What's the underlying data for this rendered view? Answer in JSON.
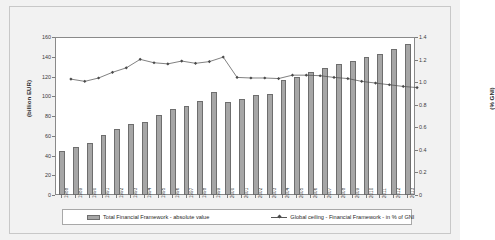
{
  "chart_data": {
    "type": "bar",
    "title": "",
    "xlabel": "",
    "ylabel": "(billion EUR)",
    "ylabel_right": "(% GNI)",
    "ylim": [
      0,
      160
    ],
    "ylim_right": [
      0,
      1.4
    ],
    "yticks": [
      "0",
      "20",
      "40",
      "60",
      "80",
      "100",
      "120",
      "140",
      "160"
    ],
    "yticks_right": [
      "0",
      "0.2",
      "0.4",
      "0.6",
      "0.8",
      "1.0",
      "1.2",
      "1.4"
    ],
    "grid": false,
    "legend_position": "bottom",
    "categories": [
      "1988",
      "1989",
      "1990",
      "1991",
      "1992",
      "1993",
      "1994",
      "1995",
      "1996",
      "1997",
      "1998",
      "1999",
      "2000",
      "2001",
      "2002",
      "2003",
      "2004",
      "2005",
      "2006",
      "2007",
      "2008",
      "2009",
      "2010",
      "2011",
      "2012",
      "2013"
    ],
    "series": [
      {
        "name": "Total Financial Framework - absolute value",
        "type": "bar",
        "axis": "left",
        "unit": "billion EUR",
        "color": "#a6a6a6",
        "values": [
          45.0,
          48.5,
          53.0,
          61.0,
          66.5,
          72.0,
          73.5,
          81.0,
          87.0,
          90.5,
          95.0,
          104.0,
          94.0,
          97.5,
          101.0,
          102.5,
          116.0,
          120.0,
          125.0,
          128.5,
          132.5,
          136.0,
          139.5,
          143.0,
          148.0,
          153.0
        ]
      },
      {
        "name": "Global ceiling - Financial Framework - in % of GNI",
        "type": "line",
        "axis": "right",
        "unit": "% of GNI",
        "color": "#4a4a4a",
        "values": [
          1.08,
          1.06,
          1.09,
          1.14,
          1.18,
          1.255,
          1.225,
          1.215,
          1.24,
          1.22,
          1.235,
          1.275,
          1.095,
          1.09,
          1.09,
          1.085,
          1.115,
          1.115,
          1.11,
          1.095,
          1.085,
          1.06,
          1.045,
          1.03,
          1.015,
          1.005
        ]
      }
    ]
  },
  "legend": {
    "bar_label": "Total Financial Framework - absolute value",
    "line_label": "Global ceiling - Financial Framework - in % of GNI"
  }
}
